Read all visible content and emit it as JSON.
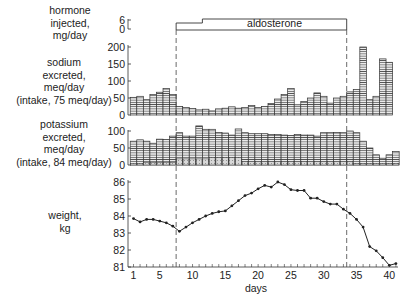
{
  "chart_data": [
    {
      "panel": "hormone",
      "type": "bar",
      "ylabel": [
        "hormone",
        "injected,",
        "mg/day"
      ],
      "yticks": [
        0,
        6
      ],
      "annotation": "aldosterone",
      "segments": [
        {
          "start_day": 8,
          "end_day": 12,
          "value": 3
        },
        {
          "start_day": 12,
          "end_day": 34,
          "value": 6
        }
      ]
    },
    {
      "panel": "sodium",
      "type": "bar",
      "ylabel": [
        "sodium",
        "excreted,",
        "meq/day",
        "(intake, 75 meq/day)"
      ],
      "yticks": [
        0,
        50,
        100,
        150,
        200
      ],
      "ylim": [
        0,
        200
      ],
      "x": [
        1,
        2,
        3,
        4,
        5,
        6,
        7,
        8,
        9,
        10,
        11,
        12,
        13,
        14,
        15,
        16,
        17,
        18,
        19,
        20,
        21,
        22,
        23,
        24,
        25,
        26,
        27,
        28,
        29,
        30,
        31,
        32,
        33,
        34,
        35,
        36,
        37,
        38,
        39,
        40,
        41
      ],
      "values": [
        52,
        55,
        45,
        60,
        67,
        78,
        60,
        25,
        22,
        19,
        15,
        17,
        12,
        18,
        20,
        24,
        20,
        22,
        28,
        22,
        25,
        34,
        47,
        60,
        78,
        30,
        40,
        50,
        65,
        55,
        35,
        50,
        55,
        68,
        75,
        200,
        45,
        55,
        165,
        155,
        0
      ]
    },
    {
      "panel": "potassium",
      "type": "bar",
      "ylabel": [
        "potassium",
        "excreted,",
        "meq/day",
        "(intake, 84 meq/day)"
      ],
      "yticks": [
        0,
        50,
        100
      ],
      "ylim": [
        0,
        120
      ],
      "x": [
        1,
        2,
        3,
        4,
        5,
        6,
        7,
        8,
        9,
        10,
        11,
        12,
        13,
        14,
        15,
        16,
        17,
        18,
        19,
        20,
        21,
        22,
        23,
        24,
        25,
        26,
        27,
        28,
        29,
        30,
        31,
        32,
        33,
        34,
        35,
        36,
        37,
        38,
        39,
        40,
        41
      ],
      "values": [
        70,
        74,
        70,
        64,
        76,
        75,
        85,
        95,
        85,
        85,
        115,
        105,
        105,
        96,
        94,
        88,
        106,
        95,
        92,
        92,
        92,
        90,
        90,
        88,
        87,
        90,
        88,
        88,
        85,
        95,
        95,
        96,
        95,
        100,
        95,
        70,
        50,
        30,
        20,
        30,
        40
      ],
      "shaded_values": [
        5,
        5,
        8,
        8,
        8,
        8,
        8,
        18,
        18,
        18,
        18,
        18,
        22,
        22,
        22,
        22,
        22,
        10,
        10,
        10,
        10,
        10,
        10,
        10,
        10,
        10,
        10,
        10,
        10,
        10,
        10,
        10,
        10,
        10,
        5,
        5,
        5,
        5,
        5,
        5,
        5
      ]
    },
    {
      "panel": "weight",
      "type": "line",
      "ylabel": [
        "weight,",
        "kg"
      ],
      "xlabel": "days",
      "yticks": [
        81,
        82,
        83,
        84,
        85,
        86
      ],
      "ylim": [
        81,
        86
      ],
      "xticks": [
        1,
        5,
        10,
        15,
        20,
        25,
        30,
        35,
        40
      ],
      "xlim": [
        0.5,
        41
      ],
      "x": [
        1,
        2,
        3,
        4,
        5,
        6,
        7,
        8,
        9,
        10,
        11,
        12,
        13,
        14,
        15,
        16,
        17,
        18,
        19,
        20,
        21,
        22,
        23,
        24,
        25,
        26,
        27,
        28,
        29,
        30,
        31,
        32,
        33,
        34,
        35,
        36,
        37,
        38,
        39,
        40,
        41
      ],
      "values": [
        83.85,
        83.65,
        83.8,
        83.8,
        83.7,
        83.6,
        83.4,
        83.1,
        83.35,
        83.6,
        83.8,
        84.0,
        84.15,
        84.25,
        84.3,
        84.6,
        84.9,
        85.2,
        85.35,
        85.6,
        85.8,
        85.7,
        86.0,
        85.85,
        85.55,
        85.5,
        85.5,
        85.05,
        85.05,
        84.85,
        84.7,
        84.7,
        84.4,
        84.15,
        83.8,
        83.35,
        82.2,
        81.95,
        81.55,
        81.1,
        81.2
      ]
    }
  ],
  "markers": {
    "dashed_lines_days": [
      8,
      34
    ]
  },
  "labels": {
    "hormone": [
      "hormone",
      "injected,",
      "mg/day"
    ],
    "sodium": [
      "sodium",
      "excreted,",
      "meq/day",
      "(intake, 75 meq/day)"
    ],
    "potassium": [
      "potassium",
      "excreted,",
      "meq/day",
      "(intake, 84 meq/day)"
    ],
    "weight": [
      "weight,",
      "kg"
    ],
    "aldosterone": "aldosterone",
    "days": "days"
  }
}
